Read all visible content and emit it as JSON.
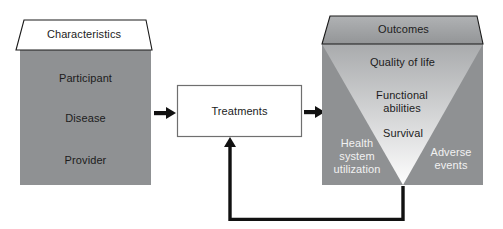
{
  "figure": {
    "characteristics": {
      "title": "Characteristics",
      "items": [
        "Participant",
        "Disease",
        "Provider"
      ]
    },
    "treatments": {
      "title": "Treatments"
    },
    "outcomes": {
      "title": "Outcomes",
      "funnel_levels": [
        "Quality of life",
        "Functional abilities",
        "Survival"
      ],
      "side_left": "Health system utilization",
      "side_right": "Adverse events"
    },
    "colors": {
      "box_gray": "#8f9193",
      "lid_gray_top": "#b0b2b4",
      "lid_gray_bottom": "#939597",
      "funnel_top": "#a9abad",
      "funnel_bottom": "#fefefe",
      "line_black": "#111111",
      "box_border": "#6f6f6f",
      "white": "#ffffff"
    }
  }
}
